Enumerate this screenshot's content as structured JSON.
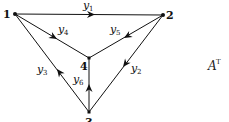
{
  "diagram": {
    "title_label": {
      "base": "A",
      "superscript": "T"
    },
    "nodes": [
      {
        "id": "1",
        "label": "1",
        "x": 15,
        "y": 14
      },
      {
        "id": "2",
        "label": "2",
        "x": 163,
        "y": 15
      },
      {
        "id": "3",
        "label": "3",
        "x": 89,
        "y": 112
      },
      {
        "id": "4",
        "label": "4",
        "x": 89,
        "y": 58
      }
    ],
    "edges": [
      {
        "id": "y1",
        "base": "y",
        "sub": "1",
        "from": "1",
        "to": "2"
      },
      {
        "id": "y2",
        "base": "y",
        "sub": "2",
        "from": "2",
        "to": "3"
      },
      {
        "id": "y3",
        "base": "y",
        "sub": "3",
        "from": "3",
        "to": "1"
      },
      {
        "id": "y4",
        "base": "y",
        "sub": "4",
        "from": "1",
        "to": "4"
      },
      {
        "id": "y5",
        "base": "y",
        "sub": "5",
        "from": "2",
        "to": "4"
      },
      {
        "id": "y6",
        "base": "y",
        "sub": "6",
        "from": "3",
        "to": "4"
      }
    ],
    "colors": {
      "stroke": "#111111",
      "background": "#ffffff"
    }
  }
}
